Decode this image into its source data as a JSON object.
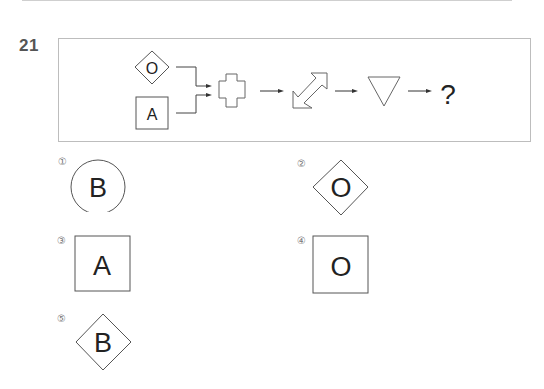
{
  "question": {
    "number": "21",
    "sequence": {
      "inputs": [
        {
          "shape": "diamond",
          "letter": "O"
        },
        {
          "shape": "square",
          "letter": "A"
        }
      ],
      "operators": [
        {
          "icon": "cross-plus-icon",
          "meaning": "combine"
        },
        {
          "icon": "double-diagonal-arrow-icon",
          "meaning": "transform"
        },
        {
          "icon": "down-triangle-icon",
          "meaning": "transform"
        }
      ],
      "result": "?"
    }
  },
  "options": [
    {
      "marker": "①",
      "shape": "circle",
      "letter": "B"
    },
    {
      "marker": "②",
      "shape": "diamond",
      "letter": "O"
    },
    {
      "marker": "③",
      "shape": "square",
      "letter": "A"
    },
    {
      "marker": "④",
      "shape": "square",
      "letter": "O"
    },
    {
      "marker": "⑤",
      "shape": "diamond",
      "letter": "B"
    }
  ]
}
